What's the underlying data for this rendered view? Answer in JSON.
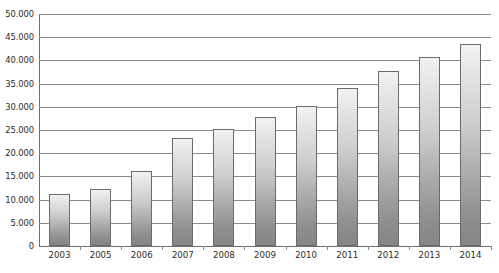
{
  "chart_data": {
    "type": "bar",
    "title": "",
    "subtitle": "",
    "xlabel": "",
    "ylabel": "",
    "categories": [
      "2003",
      "2005",
      "2006",
      "2007",
      "2008",
      "2009",
      "2010",
      "2011",
      "2012",
      "2013",
      "2014"
    ],
    "values": [
      11200,
      12300,
      16200,
      23300,
      25300,
      27900,
      30200,
      34100,
      37800,
      40800,
      43500
    ],
    "ylim": [
      0,
      50000
    ],
    "ytick_step": 5000,
    "ytick_labels": [
      "50.000",
      "45.000",
      "40.000",
      "35.000",
      "30.000",
      "25.000",
      "20.000",
      "15.000",
      "10.000",
      "5.000",
      "0"
    ],
    "ytick_values": [
      50000,
      45000,
      40000,
      35000,
      30000,
      25000,
      20000,
      15000,
      10000,
      5000,
      0
    ],
    "grid": true,
    "grid_orientation": "horizontal",
    "legend": false,
    "legend_position": "none",
    "number_format": "european-dot-thousands",
    "series": [
      {
        "name": "",
        "values": [
          11200,
          12300,
          16200,
          23300,
          25300,
          27900,
          30200,
          34100,
          37800,
          40800,
          43500
        ]
      }
    ]
  },
  "style": {
    "bar_fill_top": "#f2f2f2",
    "bar_fill_bottom": "#858585",
    "bar_border": "#6b6b6b",
    "gridline_color": "#8a8a8a",
    "axis_color": "#6e6e6e",
    "text_color": "#2b2b2b",
    "background": "#ffffff"
  }
}
